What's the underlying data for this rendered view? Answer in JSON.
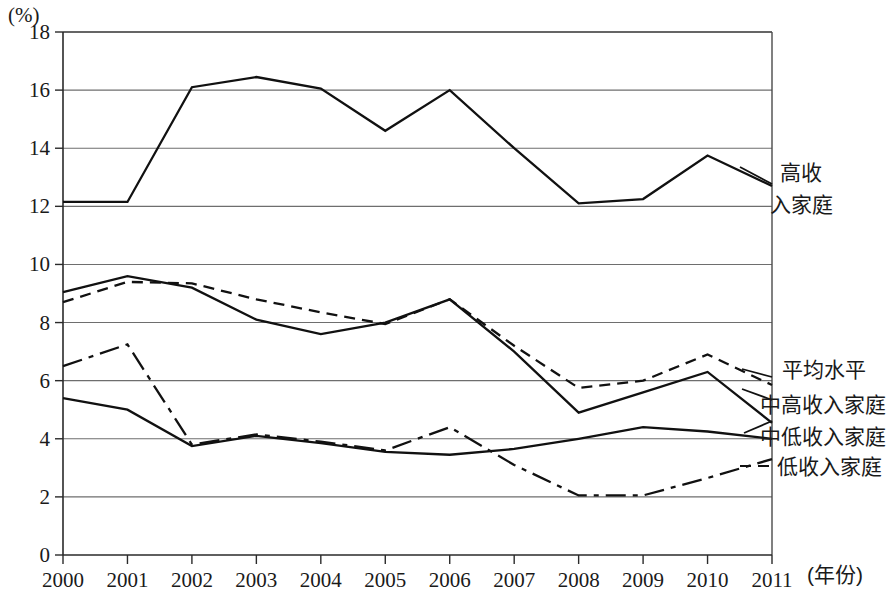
{
  "chart_data": {
    "type": "line",
    "title": "",
    "xlabel": "年份",
    "ylabel": "(%)",
    "x": [
      "2000",
      "2001",
      "2002",
      "2003",
      "2004",
      "2005",
      "2006",
      "2007",
      "2008",
      "2009",
      "2010",
      "2011"
    ],
    "categories": [
      "2000",
      "2001",
      "2002",
      "2003",
      "2004",
      "2005",
      "2006",
      "2007",
      "2008",
      "2009",
      "2010",
      "2011"
    ],
    "ylim": [
      0,
      18
    ],
    "yticks": [
      "0",
      "2",
      "4",
      "6",
      "8",
      "10",
      "12",
      "14",
      "16",
      "18"
    ],
    "grid": true,
    "legend_position": "right-inline",
    "series": [
      {
        "name": "高收入家庭",
        "style": "solid",
        "values": [
          12.15,
          12.15,
          16.1,
          16.45,
          16.05,
          14.6,
          16.0,
          14.0,
          12.1,
          12.25,
          13.75,
          12.7
        ]
      },
      {
        "name": "平均水平",
        "style": "dashed",
        "values": [
          8.7,
          9.4,
          9.35,
          8.8,
          8.35,
          7.95,
          8.8,
          7.2,
          5.75,
          6.0,
          6.9,
          5.85
        ]
      },
      {
        "name": "中高收入家庭",
        "style": "solid",
        "values": [
          9.05,
          9.6,
          9.2,
          8.1,
          7.6,
          8.0,
          8.8,
          7.0,
          4.9,
          5.6,
          6.3,
          4.55
        ]
      },
      {
        "name": "中低收入家庭",
        "style": "solid",
        "values": [
          5.4,
          5.0,
          3.75,
          4.1,
          3.85,
          3.55,
          3.45,
          3.65,
          4.0,
          4.4,
          4.25,
          4.0
        ]
      },
      {
        "name": "低收入家庭",
        "style": "dash-dot",
        "values": [
          6.5,
          7.25,
          3.8,
          4.15,
          3.9,
          3.6,
          4.4,
          3.1,
          2.05,
          2.05,
          2.65,
          3.3
        ]
      }
    ]
  },
  "axis": {
    "y_unit_label": "(%)",
    "x_unit_label": "(年份)"
  },
  "legend": {
    "high_income_line1": "高收",
    "high_income_line2": "入家庭",
    "average": "平均水平",
    "upper_middle": "中高收入家庭",
    "lower_middle": "中低收入家庭",
    "low_income": "低收入家庭"
  }
}
